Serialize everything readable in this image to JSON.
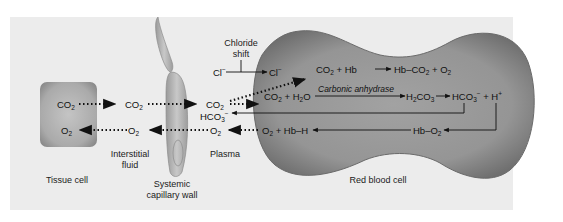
{
  "regions": {
    "tissue_cell": "Tissue cell",
    "interstitial_fluid_line1": "Interstitial",
    "interstitial_fluid_line2": "fluid",
    "capillary_wall_line1": "Systemic",
    "capillary_wall_line2": "capillary wall",
    "plasma": "Plasma",
    "red_blood_cell": "Red blood cell"
  },
  "chloride_shift": {
    "label_line1": "Chloride",
    "label_line2": "shift",
    "ion_plasma": "Cl",
    "ion_plasma_sup": "−",
    "ion_rbc": "Cl",
    "ion_rbc_sup": "−"
  },
  "species": {
    "tissue_co2": {
      "base": "CO",
      "sub": "2"
    },
    "tissue_o2": {
      "base": "O",
      "sub": "2"
    },
    "interstitial_co2": {
      "base": "CO",
      "sub": "2"
    },
    "interstitial_o2": {
      "base": "O",
      "sub": "2"
    },
    "plasma_co2": {
      "base": "CO",
      "sub": "2"
    },
    "plasma_o2": {
      "base": "O",
      "sub": "2"
    },
    "plasma_hco3": {
      "base": "HCO",
      "sub": "3",
      "sup": "−"
    }
  },
  "reactions": {
    "hb_binding": {
      "reactants": [
        "CO",
        "2",
        " + Hb"
      ],
      "products": [
        "Hb–CO",
        "2",
        " + O",
        "2"
      ]
    },
    "carbonic": {
      "reactants": [
        "CO",
        "2",
        " + H",
        "2",
        "O"
      ],
      "enzyme": "Carbonic anhydrase",
      "product": [
        "H",
        "2",
        "CO",
        "3"
      ],
      "dissociation": [
        "HCO",
        "3",
        "−",
        " + H",
        "+"
      ]
    },
    "oxygen_release": {
      "left": [
        "O",
        "2",
        " + Hb–H"
      ],
      "right": [
        "Hb–O",
        "2"
      ]
    }
  },
  "colors": {
    "panel_bg": "#ececec",
    "rbc_fill": "#8f8f8f",
    "rbc_edge": "#6a6a6a",
    "tissue_cell_fill": "#a9a9a9",
    "capillary_fill": "#b9b9b9",
    "arrow": "#111111"
  }
}
